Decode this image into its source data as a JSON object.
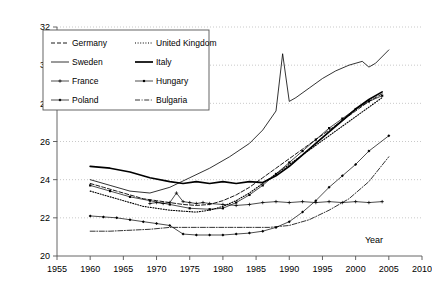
{
  "chart_data": {
    "type": "line",
    "title": "",
    "xlabel": "Year",
    "ylabel": "",
    "xlim": [
      1955,
      2010
    ],
    "ylim": [
      20,
      32
    ],
    "xticks": [
      1955,
      1960,
      1965,
      1970,
      1975,
      1980,
      1985,
      1990,
      1995,
      2000,
      2005,
      2010
    ],
    "yticks": [
      20,
      22,
      24,
      26,
      28,
      30,
      32
    ],
    "grid": "horizontal-dotted",
    "legend_position": "top-left-inside",
    "series": [
      {
        "name": "Germany",
        "style": "dashed",
        "x": [
          1960,
          1962,
          1964,
          1966,
          1968,
          1970,
          1972,
          1974,
          1976,
          1978,
          1980,
          1982,
          1984,
          1986,
          1988,
          1990,
          1992,
          1994,
          1996,
          1998,
          2000,
          2002,
          2004
        ],
        "values": [
          23.8,
          23.6,
          23.4,
          23.2,
          23.0,
          22.9,
          22.8,
          22.7,
          22.65,
          22.7,
          22.9,
          23.2,
          23.6,
          24.1,
          24.6,
          25.1,
          25.6,
          26.1,
          26.6,
          27.1,
          27.6,
          28.1,
          28.5
        ]
      },
      {
        "name": "United Kingdom",
        "style": "dotted",
        "x": [
          1960,
          1962,
          1964,
          1966,
          1968,
          1970,
          1972,
          1974,
          1976,
          1978,
          1980,
          1982,
          1984,
          1986,
          1988,
          1990,
          1992,
          1994,
          1996,
          1998,
          2000,
          2002,
          2004
        ],
        "values": [
          23.4,
          23.2,
          23.0,
          22.8,
          22.6,
          22.5,
          22.4,
          22.35,
          22.3,
          22.4,
          22.6,
          22.9,
          23.3,
          23.8,
          24.3,
          24.8,
          25.3,
          25.8,
          26.3,
          26.8,
          27.3,
          27.8,
          28.3
        ]
      },
      {
        "name": "Sweden",
        "style": "solid-thin",
        "x": [
          1960,
          1963,
          1966,
          1969,
          1972,
          1975,
          1978,
          1981,
          1984,
          1986,
          1988,
          1989,
          1990,
          1991,
          1993,
          1995,
          1997,
          1999,
          2001,
          2002,
          2003,
          2005
        ],
        "values": [
          24.0,
          23.7,
          23.4,
          23.3,
          23.6,
          24.1,
          24.6,
          25.2,
          25.9,
          26.6,
          27.6,
          30.6,
          28.1,
          28.3,
          28.8,
          29.3,
          29.7,
          30.0,
          30.2,
          29.9,
          30.1,
          30.8
        ]
      },
      {
        "name": "Italy",
        "style": "solid-thick",
        "x": [
          1960,
          1963,
          1966,
          1969,
          1972,
          1974,
          1976,
          1978,
          1980,
          1982,
          1984,
          1986,
          1988,
          1990,
          1992,
          1994,
          1996,
          1998,
          2000,
          2002,
          2004
        ],
        "values": [
          24.7,
          24.6,
          24.4,
          24.1,
          23.9,
          23.8,
          23.9,
          23.8,
          23.9,
          23.8,
          23.9,
          23.85,
          24.2,
          24.7,
          25.3,
          25.9,
          26.5,
          27.1,
          27.7,
          28.2,
          28.6
        ]
      },
      {
        "name": "France",
        "style": "solid-cross",
        "x": [
          1969,
          1970,
          1971,
          1972,
          1973,
          1974,
          1975,
          1976,
          1977,
          1978,
          1980,
          1982,
          1984,
          1986,
          1988,
          1990,
          1992,
          1994,
          1996,
          1998,
          2000,
          2002,
          2004
        ],
        "values": [
          22.75,
          22.8,
          22.75,
          22.8,
          23.3,
          22.85,
          22.8,
          22.75,
          22.8,
          22.75,
          22.7,
          22.65,
          22.7,
          22.8,
          22.85,
          22.8,
          22.85,
          22.8,
          22.85,
          22.8,
          22.85,
          22.8,
          22.85
        ]
      },
      {
        "name": "Hungary",
        "style": "solid-square",
        "x": [
          1960,
          1963,
          1966,
          1969,
          1972,
          1975,
          1978,
          1980,
          1982,
          1984,
          1986,
          1988,
          1990,
          1992,
          1994,
          1996,
          1998,
          2000,
          2002,
          2004
        ],
        "values": [
          23.7,
          23.4,
          23.1,
          22.9,
          22.7,
          22.5,
          22.45,
          22.5,
          22.8,
          23.2,
          23.7,
          24.3,
          24.9,
          25.5,
          26.1,
          26.7,
          27.2,
          27.7,
          28.1,
          28.4
        ]
      },
      {
        "name": "Poland",
        "style": "solid-diamond",
        "x": [
          1960,
          1962,
          1964,
          1966,
          1968,
          1970,
          1972,
          1974,
          1976,
          1978,
          1980,
          1982,
          1984,
          1986,
          1988,
          1990,
          1992,
          1994,
          1996,
          1998,
          2000,
          2002,
          2005
        ],
        "values": [
          22.1,
          22.05,
          22.0,
          21.9,
          21.8,
          21.7,
          21.6,
          21.15,
          21.1,
          21.1,
          21.1,
          21.15,
          21.2,
          21.3,
          21.5,
          21.8,
          22.3,
          22.9,
          23.6,
          24.2,
          24.8,
          25.5,
          26.3
        ]
      },
      {
        "name": "Bulgaria",
        "style": "dash-dot",
        "x": [
          1960,
          1963,
          1966,
          1969,
          1972,
          1975,
          1978,
          1981,
          1984,
          1987,
          1990,
          1993,
          1996,
          1999,
          2002,
          2005
        ],
        "values": [
          21.3,
          21.3,
          21.35,
          21.4,
          21.5,
          21.5,
          21.5,
          21.5,
          21.5,
          21.5,
          21.6,
          21.9,
          22.4,
          23.0,
          23.9,
          25.2
        ]
      }
    ]
  },
  "legend": {
    "items": [
      {
        "label": "Germany"
      },
      {
        "label": "United Kingdom"
      },
      {
        "label": "Sweden"
      },
      {
        "label": "Italy"
      },
      {
        "label": "France"
      },
      {
        "label": "Hungary"
      },
      {
        "label": "Poland"
      },
      {
        "label": "Bulgaria"
      }
    ]
  },
  "axis": {
    "x_title": "Year"
  }
}
